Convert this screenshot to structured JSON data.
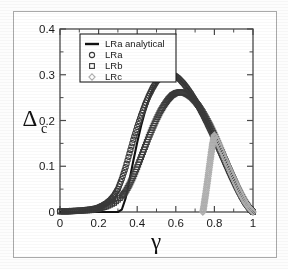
{
  "figure": {
    "border_color": "#a9a9a9",
    "background": "#ffffff"
  },
  "axes": {
    "x_title": "γ",
    "y_title_main": "Δ",
    "y_title_sub": "c",
    "x_ticks": [
      "0",
      "0.2",
      "0.4",
      "0.6",
      "0.8",
      "1"
    ],
    "y_ticks": [
      "0",
      "0.1",
      "0.2",
      "0.3",
      "0.4"
    ],
    "x_tick_values": [
      0,
      0.2,
      0.4,
      0.6,
      0.8,
      1
    ],
    "y_tick_values": [
      0,
      0.1,
      0.2,
      0.3,
      0.4
    ],
    "x_minor_count": 1,
    "y_minor_count": 1
  },
  "legend": {
    "position": "upper-left-inside",
    "border_color": "#222222",
    "entries": [
      {
        "label": "LRa analytical",
        "marker": "line",
        "color": "#111111"
      },
      {
        "label": "LRa",
        "marker": "circle",
        "color": "#3a3a3a"
      },
      {
        "label": "LRb",
        "marker": "square",
        "color": "#3a3a3a"
      },
      {
        "label": "LRc",
        "marker": "diamond",
        "color": "#b0b0b0"
      }
    ]
  },
  "chart_data": {
    "type": "line",
    "title": "",
    "xlabel": "γ",
    "ylabel": "Δ_c",
    "xlim": [
      0,
      1
    ],
    "ylim": [
      0,
      0.4
    ],
    "grid": false,
    "legend_position": "upper left",
    "series": [
      {
        "name": "LRa analytical",
        "marker": "none",
        "linestyle": "solid",
        "color": "#111111",
        "x": [
          0.0,
          0.05,
          0.1,
          0.15,
          0.2,
          0.25,
          0.28,
          0.3,
          0.32,
          0.34,
          0.36,
          0.38,
          0.4,
          0.42,
          0.44,
          0.46,
          0.48,
          0.5,
          0.52,
          0.54,
          0.56,
          0.58,
          0.6,
          0.62,
          0.64,
          0.66,
          0.68,
          0.7,
          0.72,
          0.74,
          0.76,
          0.78,
          0.8,
          0.82,
          0.84,
          0.86,
          0.88,
          0.9,
          0.92,
          0.94,
          0.96,
          0.98,
          1.0
        ],
        "y": [
          0.0,
          0.0,
          0.0,
          0.0,
          0.0,
          0.0,
          0.0,
          0.0,
          0.005,
          0.03,
          0.07,
          0.112,
          0.152,
          0.188,
          0.219,
          0.245,
          0.266,
          0.282,
          0.293,
          0.299,
          0.302,
          0.301,
          0.297,
          0.29,
          0.281,
          0.27,
          0.258,
          0.244,
          0.229,
          0.213,
          0.196,
          0.178,
          0.16,
          0.141,
          0.122,
          0.103,
          0.084,
          0.066,
          0.049,
          0.033,
          0.019,
          0.008,
          0.0
        ]
      },
      {
        "name": "LRa",
        "marker": "circle",
        "linestyle": "none",
        "color": "#3a3a3a",
        "x": [
          0.0,
          0.04,
          0.08,
          0.12,
          0.16,
          0.2,
          0.22,
          0.24,
          0.26,
          0.28,
          0.3,
          0.32,
          0.34,
          0.36,
          0.38,
          0.4,
          0.42,
          0.44,
          0.46,
          0.48,
          0.5,
          0.52,
          0.54,
          0.56,
          0.58,
          0.6,
          0.62,
          0.64,
          0.66,
          0.68,
          0.7,
          0.72,
          0.74,
          0.76,
          0.78,
          0.8,
          0.82,
          0.84,
          0.86,
          0.88,
          0.9,
          0.92,
          0.94,
          0.96,
          0.98,
          1.0
        ],
        "y": [
          0.002,
          0.002,
          0.003,
          0.004,
          0.006,
          0.01,
          0.014,
          0.019,
          0.026,
          0.036,
          0.05,
          0.072,
          0.098,
          0.128,
          0.158,
          0.186,
          0.211,
          0.234,
          0.254,
          0.271,
          0.285,
          0.294,
          0.3,
          0.302,
          0.301,
          0.297,
          0.29,
          0.281,
          0.27,
          0.258,
          0.244,
          0.229,
          0.213,
          0.196,
          0.178,
          0.16,
          0.141,
          0.122,
          0.103,
          0.084,
          0.066,
          0.049,
          0.033,
          0.019,
          0.008,
          0.0
        ]
      },
      {
        "name": "LRb",
        "marker": "square",
        "linestyle": "none",
        "color": "#3a3a3a",
        "x": [
          0.0,
          0.04,
          0.08,
          0.12,
          0.16,
          0.2,
          0.24,
          0.28,
          0.32,
          0.34,
          0.36,
          0.38,
          0.4,
          0.42,
          0.44,
          0.46,
          0.48,
          0.5,
          0.52,
          0.54,
          0.56,
          0.58,
          0.6,
          0.62,
          0.64,
          0.66,
          0.68,
          0.7,
          0.72,
          0.74,
          0.76,
          0.78,
          0.8,
          0.82,
          0.84,
          0.86,
          0.88,
          0.9,
          0.92,
          0.94,
          0.96,
          0.98,
          1.0
        ],
        "y": [
          0.001,
          0.001,
          0.002,
          0.003,
          0.004,
          0.007,
          0.012,
          0.02,
          0.034,
          0.045,
          0.06,
          0.078,
          0.098,
          0.12,
          0.142,
          0.164,
          0.184,
          0.203,
          0.22,
          0.234,
          0.246,
          0.255,
          0.26,
          0.262,
          0.261,
          0.257,
          0.251,
          0.242,
          0.231,
          0.218,
          0.203,
          0.187,
          0.169,
          0.15,
          0.131,
          0.111,
          0.091,
          0.072,
          0.053,
          0.036,
          0.021,
          0.009,
          0.0
        ]
      },
      {
        "name": "LRc",
        "marker": "diamond",
        "linestyle": "none",
        "color": "#b0b0b0",
        "x": [
          0.74,
          0.745,
          0.75,
          0.755,
          0.76,
          0.765,
          0.77,
          0.775,
          0.78,
          0.785,
          0.79,
          0.795,
          0.8,
          0.82,
          0.84,
          0.86,
          0.88,
          0.9,
          0.92,
          0.94,
          0.96,
          0.98,
          1.0
        ],
        "y": [
          0.0,
          0.012,
          0.026,
          0.04,
          0.055,
          0.07,
          0.086,
          0.102,
          0.118,
          0.133,
          0.147,
          0.158,
          0.168,
          0.15,
          0.131,
          0.111,
          0.091,
          0.072,
          0.053,
          0.036,
          0.021,
          0.009,
          0.0
        ]
      }
    ]
  }
}
